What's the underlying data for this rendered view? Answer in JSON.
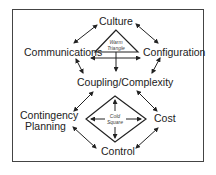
{
  "diagram": {
    "nodes": {
      "culture": "Culture",
      "communications": "Communications",
      "configuration": "Configuration",
      "coupling": "Coupling/Complexity",
      "contingency_1": "Contingency",
      "contingency_2": "Planning",
      "cost": "Cost",
      "control": "Control"
    },
    "warm_triangle": {
      "line1": "Warm",
      "line2": "Triangle"
    },
    "cold_square": {
      "line1": "Cold",
      "line2": "Square"
    },
    "colors": {
      "stroke": "#222222",
      "border": "#444444",
      "background": "#ffffff"
    }
  }
}
